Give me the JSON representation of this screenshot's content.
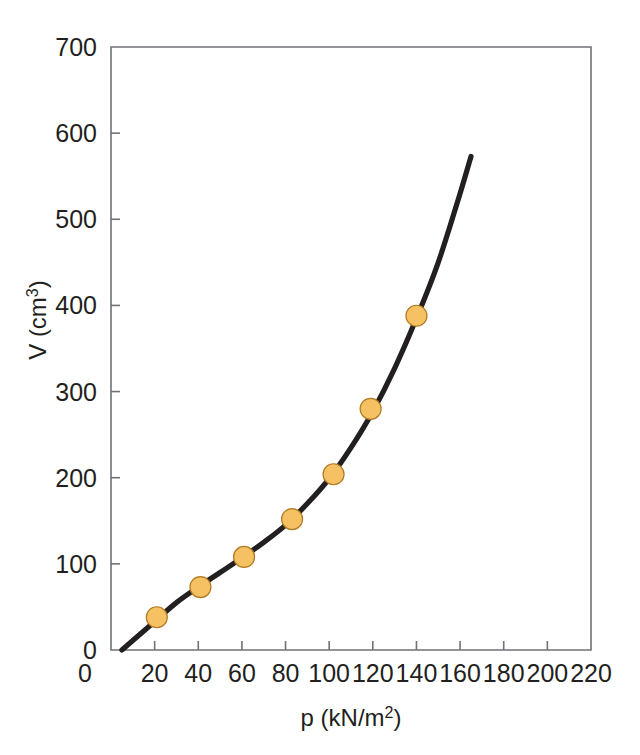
{
  "figure": {
    "background_color": "#ffffff",
    "frame_color": "#6f7276",
    "curve_color": "#231f20",
    "marker_fill": "#f5c163",
    "marker_edge": "#b07a22"
  },
  "chart_data": {
    "type": "scatter",
    "title": "",
    "subtitle": "",
    "xlabel": "p (kN/m2)",
    "xlabel_base": "p (kN/m",
    "xlabel_sup": "2",
    "xlabel_close": ")",
    "ylabel": "V (cm3)",
    "ylabel_base": "V (cm",
    "ylabel_sup": "3",
    "ylabel_close": ")",
    "xlim": [
      0,
      220
    ],
    "ylim": [
      0,
      700
    ],
    "xticks": [
      0,
      20,
      40,
      60,
      80,
      100,
      120,
      140,
      160,
      180,
      200,
      220
    ],
    "yticks": [
      0,
      100,
      200,
      300,
      400,
      500,
      600,
      700
    ],
    "xtick_labels": [
      "0",
      "20",
      "40",
      "60",
      "80",
      "100",
      "120",
      "140",
      "160",
      "180",
      "200",
      "220"
    ],
    "ytick_labels": [
      "0",
      "100",
      "200",
      "300",
      "400",
      "500",
      "600",
      "700"
    ],
    "grid": false,
    "legend": null,
    "legend_position": "none",
    "series": [
      {
        "name": "measured points",
        "marker": "circle",
        "x": [
          21,
          41,
          61,
          83,
          102,
          119,
          140
        ],
        "y": [
          38,
          73,
          108,
          152,
          204,
          280,
          388
        ]
      },
      {
        "name": "fitted curve",
        "marker": "none",
        "x": [
          5,
          10,
          20,
          30,
          40,
          50,
          60,
          70,
          80,
          90,
          100,
          110,
          120,
          130,
          140,
          150,
          160,
          165
        ],
        "y": [
          0,
          11,
          33,
          55,
          73,
          90,
          107,
          125,
          145,
          170,
          199,
          235,
          277,
          327,
          385,
          450,
          530,
          573
        ]
      }
    ],
    "annotations": []
  }
}
